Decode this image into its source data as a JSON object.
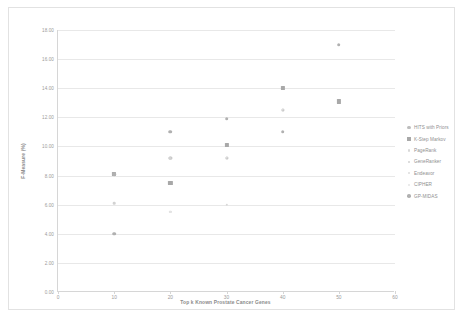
{
  "chart_data": {
    "type": "scatter",
    "title": "",
    "xlabel": "Top k Known Prostate Cancer Genes",
    "ylabel": "F-Measure (%)",
    "xlim": [
      0,
      60
    ],
    "ylim": [
      0,
      18
    ],
    "xticks": [
      "0",
      "10",
      "20",
      "30",
      "40",
      "50",
      "60"
    ],
    "yticks": [
      "0.00",
      "2.00",
      "4.00",
      "6.00",
      "8.00",
      "10.00",
      "12.00",
      "14.00",
      "16.00",
      "18.00"
    ],
    "grid": "horizontal",
    "legend_position": "right",
    "series": [
      {
        "name": "HITS with Priors",
        "marker": "circle",
        "color": "#bdbdbd",
        "size": 3.2,
        "points": [
          [
            10,
            8.1
          ],
          [
            20,
            9.2
          ],
          [
            30,
            9.2
          ],
          [
            40,
            12.5
          ],
          [
            50,
            13.1
          ]
        ]
      },
      {
        "name": "K-Step Markov",
        "marker": "square",
        "color": "#a8a8a8",
        "size": 4.2,
        "points": [
          [
            10,
            8.1
          ],
          [
            20,
            7.5
          ],
          [
            30,
            10.1
          ],
          [
            40,
            14.0
          ],
          [
            50,
            13.1
          ]
        ]
      },
      {
        "name": "PageRank",
        "marker": "circle",
        "color": "#d8d8d8",
        "size": 2.4,
        "points": [
          [
            20,
            5.5
          ],
          [
            30,
            6.0
          ]
        ]
      },
      {
        "name": "GeneRanker",
        "marker": "circle",
        "color": "#d2d2d2",
        "size": 2.6,
        "points": [
          [
            10,
            6.1
          ],
          [
            20,
            9.2
          ]
        ]
      },
      {
        "name": "Endeavor",
        "marker": "circle",
        "color": "#dcdcdc",
        "size": 2.4,
        "points": [
          [
            30,
            9.2
          ],
          [
            40,
            12.5
          ]
        ]
      },
      {
        "name": "CIPHER",
        "marker": "circle",
        "color": "#e4e4e4",
        "size": 2.2,
        "points": [
          [
            10,
            4.0
          ],
          [
            20,
            5.5
          ]
        ]
      },
      {
        "name": "GP-MIDAS",
        "marker": "circle",
        "color": "#b0b0b0",
        "size": 3.6,
        "points": [
          [
            10,
            8.1
          ],
          [
            10,
            4.0
          ],
          [
            20,
            11.0
          ],
          [
            30,
            11.9
          ],
          [
            40,
            11.0
          ],
          [
            50,
            17.0
          ]
        ]
      }
    ]
  }
}
